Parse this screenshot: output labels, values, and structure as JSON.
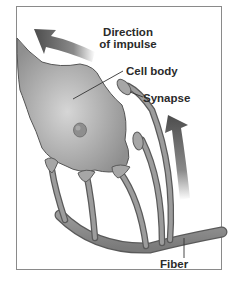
{
  "diagram": {
    "type": "neuron-synapse-illustration",
    "labels": {
      "direction_line1": "Direction",
      "direction_line2": "of impulse",
      "cell_body": "Cell body",
      "synapse": "Synapse",
      "fiber": "Fiber"
    },
    "icons": {
      "impulse_arrow_top": "curved-arrow-up-left",
      "impulse_arrow_right": "curved-arrow-up"
    },
    "colors": {
      "frame": "#8a8a8a",
      "cell_fill": "#a9a9a9",
      "cell_outline": "#555555",
      "arrow": "#555555",
      "text": "#2a2a2a"
    }
  }
}
